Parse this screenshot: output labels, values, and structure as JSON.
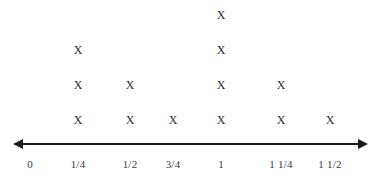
{
  "chart_data": {
    "type": "dot-plot",
    "title": "",
    "xlabel": "",
    "ylabel": "",
    "mark": "X",
    "grid": false,
    "legend": null,
    "axis": {
      "kind": "number-line",
      "left_arrow": true,
      "right_arrow": true,
      "xlim": [
        0,
        1.625
      ]
    },
    "categories": [
      "0",
      "1/4",
      "1/2",
      "3/4",
      "1",
      "1 1/4",
      "1 1/2"
    ],
    "values": [
      0,
      3,
      2,
      1,
      4,
      2,
      1
    ],
    "points": [
      {
        "label": "0",
        "value": 0,
        "x_px": 30
      },
      {
        "label": "1/4",
        "value": 3,
        "x_px": 78
      },
      {
        "label": "1/2",
        "value": 2,
        "x_px": 130
      },
      {
        "label": "3/4",
        "value": 1,
        "x_px": 173
      },
      {
        "label": "1",
        "value": 4,
        "x_px": 221
      },
      {
        "label": "1 1/4",
        "value": 2,
        "x_px": 281
      },
      {
        "label": "1 1/2",
        "value": 1,
        "x_px": 330
      }
    ],
    "colors": {
      "axis": "#1a1a1a",
      "mark": "#2b2b2b",
      "label": "#3a3a3a",
      "background": "#ffffff"
    }
  },
  "layout": {
    "axis_y_px": 143,
    "axis_x_start_px": 13,
    "axis_x_end_px": 368,
    "label_y_px": 158,
    "stack_base_y_px": 120,
    "stack_step_px": 35
  }
}
